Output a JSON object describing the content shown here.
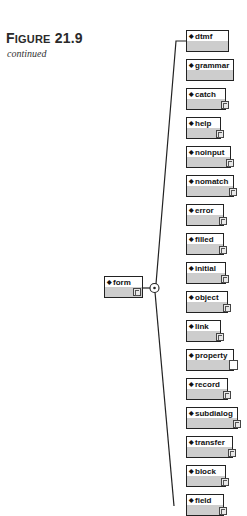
{
  "figure": {
    "label_prefix": "F",
    "label_rest": "IGURE",
    "number": "21.9",
    "subtitle": "continued"
  },
  "parent": {
    "label": "form",
    "expand_icon": "expand-icon"
  },
  "compositor": {
    "icon": "sequence-choice-icon"
  },
  "children": [
    {
      "label": "dtmf",
      "top": 30,
      "width": 43,
      "expander": "none"
    },
    {
      "label": "grammar",
      "top": 59,
      "width": 48,
      "expander": "none"
    },
    {
      "label": "catch",
      "top": 88,
      "width": 40,
      "expander": "expand"
    },
    {
      "label": "help",
      "top": 117,
      "width": 35,
      "expander": "expand"
    },
    {
      "label": "noinput",
      "top": 146,
      "width": 45,
      "expander": "expand"
    },
    {
      "label": "nomatch",
      "top": 175,
      "width": 48,
      "expander": "expand"
    },
    {
      "label": "error",
      "top": 204,
      "width": 38,
      "expander": "expand"
    },
    {
      "label": "filled",
      "top": 233,
      "width": 38,
      "expander": "expand"
    },
    {
      "label": "initial",
      "top": 262,
      "width": 40,
      "expander": "expand"
    },
    {
      "label": "object",
      "top": 291,
      "width": 42,
      "expander": "expand"
    },
    {
      "label": "link",
      "top": 320,
      "width": 35,
      "expander": "link"
    },
    {
      "label": "property",
      "top": 349,
      "width": 48,
      "expander": "blank"
    },
    {
      "label": "record",
      "top": 378,
      "width": 42,
      "expander": "expand"
    },
    {
      "label": "subdialog",
      "top": 407,
      "width": 52,
      "expander": "expand"
    },
    {
      "label": "transfer",
      "top": 436,
      "width": 47,
      "expander": "expand"
    },
    {
      "label": "block",
      "top": 465,
      "width": 40,
      "expander": "expand"
    },
    {
      "label": "field",
      "top": 494,
      "width": 38,
      "expander": "expand"
    }
  ],
  "colors": {
    "border": "#222222",
    "fill_bottom": "#cdcdcd",
    "line": "#222222"
  }
}
